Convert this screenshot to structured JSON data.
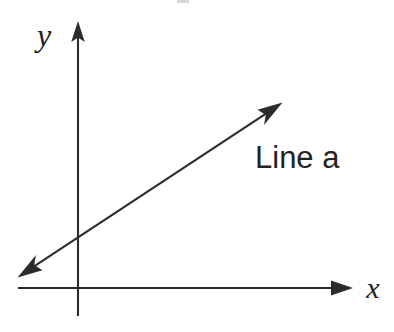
{
  "figure": {
    "background_color": "#ffffff",
    "ink_color": "#2b2b2b",
    "width": 394,
    "height": 332
  },
  "axes": {
    "x_axis": {
      "label": "x",
      "icon": "arrow-right-icon",
      "start_x": 18,
      "end_x": 353,
      "y": 288,
      "label_x": 373,
      "label_y": 298,
      "label_font_size": 30
    },
    "y_axis": {
      "label": "y",
      "icon": "arrow-up-icon",
      "x": 78,
      "top_y": 22,
      "bottom_y": 316,
      "label_x": 44,
      "label_y": 46,
      "label_font_size": 32
    },
    "origin": {
      "x": 78,
      "y": 288
    }
  },
  "line": {
    "label": "Line a",
    "label_x": 255,
    "label_y": 168,
    "label_font_size": 31,
    "arrow_style": "double-headed",
    "start": {
      "x": 18,
      "y": 277
    },
    "end": {
      "x": 282,
      "y": 103
    },
    "slope_note": "negative-x to positive-x rising"
  },
  "chart_data": {
    "type": "line",
    "title": "",
    "xlabel": "x",
    "ylabel": "y",
    "grid": false,
    "legend": false,
    "annotations": [
      {
        "text": "Line a",
        "x": 255,
        "y": 168
      },
      {
        "text": "x",
        "x": 373,
        "y": 298
      },
      {
        "text": "y",
        "x": 44,
        "y": 46
      }
    ],
    "series": [
      {
        "name": "Line a",
        "arrowheads": "both",
        "points_px": [
          [
            18,
            277
          ],
          [
            282,
            103
          ]
        ]
      }
    ],
    "axis_px": {
      "x_axis": [
        [
          18,
          288
        ],
        [
          353,
          288
        ]
      ],
      "y_axis": [
        [
          78,
          316
        ],
        [
          78,
          22
        ]
      ]
    }
  }
}
